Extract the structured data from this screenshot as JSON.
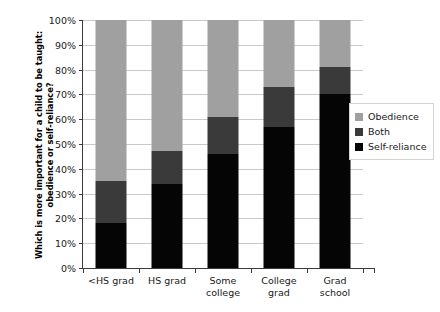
{
  "chart_data": {
    "type": "bar",
    "subtype": "stacked-100-percent",
    "title": "",
    "xlabel": "",
    "ylabel": "Which is more important for a child to be taught: obedience or self-reliance?",
    "categories": [
      "<HS grad",
      "HS grad",
      "Some college",
      "College grad",
      "Grad school"
    ],
    "series": [
      {
        "name": "Self-reliance",
        "color": "#050505",
        "values": [
          18,
          34,
          46,
          57,
          70
        ]
      },
      {
        "name": "Both",
        "color": "#3a3a3a",
        "values": [
          17,
          13,
          15,
          16,
          11
        ]
      },
      {
        "name": "Obedience",
        "color": "#a0a0a0",
        "values": [
          65,
          53,
          39,
          27,
          19
        ]
      }
    ],
    "stack_order_bottom_to_top": [
      "Self-reliance",
      "Both",
      "Obedience"
    ],
    "segment_tops_percent": {
      "self_reliance": [
        18,
        34,
        46,
        57,
        70
      ],
      "both": [
        35,
        47,
        61,
        73,
        81
      ],
      "obedience": [
        100,
        100,
        100,
        100,
        100
      ]
    },
    "ylim": [
      0,
      100
    ],
    "ytick_labels": [
      "0%",
      "10%",
      "20%",
      "30%",
      "40%",
      "50%",
      "60%",
      "70%",
      "80%",
      "90%",
      "100%"
    ],
    "ytick_values": [
      0,
      10,
      20,
      30,
      40,
      50,
      60,
      70,
      80,
      90,
      100
    ],
    "grid": true,
    "legend_position": "right-middle",
    "legend_entries": [
      {
        "label": "Obedience",
        "color": "#a0a0a0"
      },
      {
        "label": "Both",
        "color": "#3a3a3a"
      },
      {
        "label": "Self-reliance",
        "color": "#050505"
      }
    ]
  },
  "xlabel_lines": [
    [
      "<HS grad"
    ],
    [
      "HS grad"
    ],
    [
      "Some",
      "college"
    ],
    [
      "College",
      "grad"
    ],
    [
      "Grad",
      "school"
    ]
  ]
}
